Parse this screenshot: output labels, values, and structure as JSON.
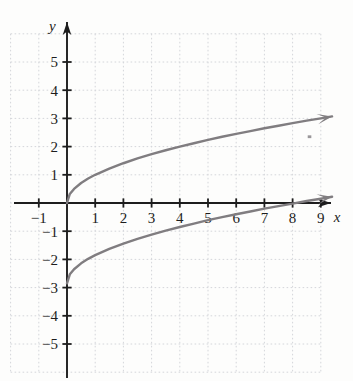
{
  "chart_data": {
    "type": "line",
    "title": "",
    "subtitle": "",
    "xlabel": "x",
    "ylabel": "y",
    "xlim": [
      -2,
      11
    ],
    "ylim": [
      -6,
      5.8
    ],
    "grid": true,
    "grid_style": "dotted",
    "grid_spacing": 1,
    "legend": false,
    "legend_position": "none",
    "x_ticks": [
      -1,
      1,
      2,
      3,
      4,
      5,
      6,
      7,
      8,
      9
    ],
    "x_tick_labels": [
      "−1",
      "1",
      "2",
      "3",
      "4",
      "5",
      "6",
      "7",
      "8",
      "9"
    ],
    "y_ticks": [
      -5,
      -4,
      -3,
      -2,
      -1,
      1,
      2,
      3,
      4,
      5
    ],
    "y_tick_labels": [
      "−5",
      "−4",
      "−3",
      "−2",
      "−1",
      "1",
      "2",
      "3",
      "4",
      "5"
    ],
    "series": [
      {
        "name": "upper-curve",
        "equation": "y = sqrt(x)",
        "color": "#807d80",
        "arrow_end": true,
        "x": [
          0,
          0.1,
          0.25,
          0.5,
          0.75,
          1,
          1.5,
          2,
          2.5,
          3,
          3.5,
          4,
          4.5,
          5,
          5.5,
          6,
          6.5,
          7,
          7.5,
          8,
          8.5,
          9,
          9.4
        ],
        "values": [
          0,
          0.32,
          0.5,
          0.71,
          0.87,
          1,
          1.22,
          1.41,
          1.58,
          1.73,
          1.87,
          2,
          2.12,
          2.24,
          2.35,
          2.45,
          2.55,
          2.65,
          2.74,
          2.83,
          2.92,
          3,
          3.07
        ]
      },
      {
        "name": "lower-curve",
        "equation": "y = sqrt(x) − 2.85",
        "color": "#807d80",
        "arrow_end": true,
        "x": [
          0,
          0.1,
          0.25,
          0.5,
          0.75,
          1,
          1.5,
          2,
          2.5,
          3,
          3.5,
          4,
          4.5,
          5,
          5.5,
          6,
          6.5,
          7,
          7.5,
          8,
          8.5,
          9,
          9.4
        ],
        "values": [
          -2.85,
          -2.53,
          -2.35,
          -2.14,
          -1.98,
          -1.85,
          -1.63,
          -1.44,
          -1.27,
          -1.12,
          -0.98,
          -0.85,
          -0.73,
          -0.61,
          -0.5,
          -0.4,
          -0.3,
          -0.2,
          -0.11,
          -0.02,
          0.07,
          0.15,
          0.22
        ]
      }
    ],
    "annotations": [
      {
        "name": "stray-mark",
        "x": 8.6,
        "y": 2.35
      }
    ],
    "colors": {
      "background": "#fdfdfc",
      "grid": "#d7d9dc",
      "axis": "#1d1d1d",
      "curve": "#807d80",
      "text": "#1d1d1d"
    }
  }
}
